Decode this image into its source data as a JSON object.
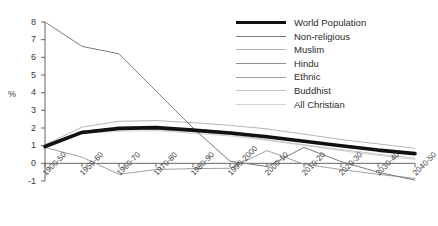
{
  "chart_data": {
    "type": "line",
    "title": "",
    "xlabel": "",
    "ylabel": "%",
    "ylim": [
      -1,
      8
    ],
    "yticks": [
      -1,
      0,
      1,
      2,
      3,
      4,
      5,
      6,
      7,
      8
    ],
    "grid": false,
    "legend_position": "top-right",
    "categories": [
      "1900-50",
      "1950-60",
      "1960-70",
      "1970-80",
      "1980-90",
      "1990-2000",
      "2000-10",
      "2010-20",
      "2020-30",
      "2030-40",
      "2040-50"
    ],
    "series": [
      {
        "name": "World Population",
        "color": "#111111",
        "width": 3.6,
        "values": [
          0.95,
          1.75,
          1.98,
          2.02,
          1.88,
          1.72,
          1.5,
          1.25,
          1.0,
          0.75,
          0.55
        ]
      },
      {
        "name": "Non-religious",
        "color": "#7a7a7a",
        "width": 1.0,
        "values": [
          8.0,
          6.62,
          6.2,
          4.1,
          2.0,
          0.12,
          -0.18,
          0.9,
          0.1,
          -0.5,
          -0.95
        ]
      },
      {
        "name": "Muslim",
        "color": "#b5b5b5",
        "width": 1.0,
        "values": [
          1.05,
          2.05,
          2.38,
          2.42,
          2.3,
          2.15,
          1.95,
          1.65,
          1.35,
          1.1,
          0.85
        ]
      },
      {
        "name": "Hindu",
        "color": "#8f8f8f",
        "width": 1.0,
        "values": [
          1.0,
          1.82,
          2.0,
          2.05,
          1.92,
          1.78,
          1.52,
          1.25,
          0.98,
          0.72,
          0.5
        ]
      },
      {
        "name": "Ethnic",
        "color": "#a0a0a0",
        "width": 1.0,
        "values": [
          0.9,
          0.35,
          -0.62,
          -0.35,
          -0.3,
          -0.28,
          0.72,
          -0.05,
          -0.35,
          -0.62,
          -0.85
        ]
      },
      {
        "name": "Buddhist",
        "color": "#c2c2c2",
        "width": 1.0,
        "values": [
          1.0,
          1.7,
          1.9,
          1.92,
          1.78,
          1.62,
          1.35,
          1.05,
          0.78,
          0.52,
          0.3
        ]
      },
      {
        "name": "All Christian",
        "color": "#d2d2d2",
        "width": 1.0,
        "values": [
          1.0,
          1.68,
          1.82,
          1.85,
          1.7,
          1.55,
          1.3,
          1.02,
          0.72,
          0.45,
          0.22
        ]
      }
    ]
  },
  "legend": {
    "items": [
      {
        "label": "World Population"
      },
      {
        "label": "Non-religious"
      },
      {
        "label": "Muslim"
      },
      {
        "label": "Hindu"
      },
      {
        "label": "Ethnic"
      },
      {
        "label": "Buddhist"
      },
      {
        "label": "All Christian"
      }
    ]
  },
  "axes": {
    "y_axis_title": "%"
  }
}
